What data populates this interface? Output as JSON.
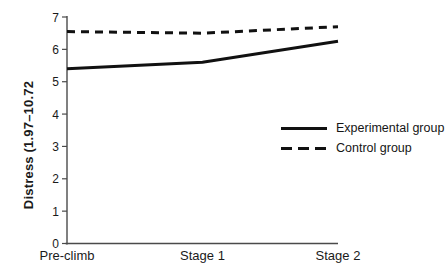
{
  "chart_data": {
    "type": "line",
    "categories": [
      "Pre-climb",
      "Stage 1",
      "Stage 2"
    ],
    "series": [
      {
        "name": "Experimental group",
        "style": "solid",
        "values": [
          5.4,
          5.6,
          6.25
        ]
      },
      {
        "name": "Control group",
        "style": "dashed",
        "values": [
          6.55,
          6.5,
          6.7
        ]
      }
    ],
    "title": "",
    "xlabel": "",
    "ylabel": "Distress (1.97–10.72",
    "ylim": [
      0,
      7
    ],
    "yticks": [
      0,
      1,
      2,
      3,
      4,
      5,
      6,
      7
    ],
    "grid": false,
    "legend_position": "right-middle",
    "line_color": "#111111",
    "axis_color": "#4a4a4a",
    "background": "#ffffff"
  }
}
